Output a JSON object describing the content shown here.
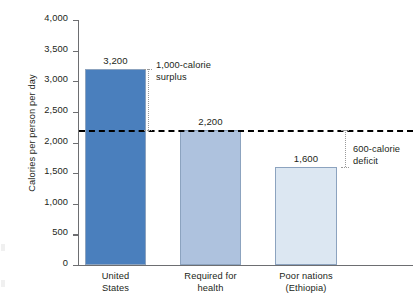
{
  "chart_data": {
    "type": "bar",
    "title": "",
    "xlabel": "",
    "ylabel": "Calories per person per day",
    "ylim": [
      0,
      4000
    ],
    "grid": false,
    "legend": "none",
    "categories": [
      "United\nStates",
      "Required for\nhealth",
      "Poor nations\n(Ethiopia)"
    ],
    "category_lines": [
      [
        "United",
        "States"
      ],
      [
        "Required for",
        "health"
      ],
      [
        "Poor nations",
        "(Ethiopia)"
      ]
    ],
    "values": [
      3200,
      2200,
      1600
    ],
    "value_labels": [
      "3,200",
      "2,200",
      "1,600"
    ],
    "bar_colors": [
      "#4a7fbd",
      "#aec2de",
      "#dce7f2"
    ],
    "bar_border_color": "#8ca3bf",
    "y_ticks": [
      0,
      500,
      1000,
      1500,
      2000,
      2500,
      3000,
      3500,
      4000
    ],
    "y_tick_labels": [
      "0",
      "500",
      "1,000",
      "1,500",
      "2,000",
      "2,500",
      "3,000",
      "3,500",
      "4,000"
    ],
    "reference_line": {
      "value": 2200,
      "style": "dashed",
      "color": "#000000"
    },
    "annotations": [
      {
        "id": "surplus",
        "lines": [
          "1,000-calorie",
          "surplus"
        ],
        "from_value": 3200,
        "to_value": 2200,
        "magnitude": 1000
      },
      {
        "id": "deficit",
        "lines": [
          "600-calorie",
          "deficit"
        ],
        "from_value": 2200,
        "to_value": 1600,
        "magnitude": 600
      }
    ]
  }
}
